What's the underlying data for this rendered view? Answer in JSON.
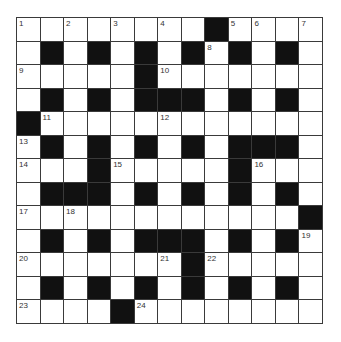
{
  "puzzle": {
    "rows": 13,
    "cols": 13,
    "colors": {
      "white_cell": "#ffffff",
      "black_cell": "#111111",
      "grid_line": "#3a3a3a",
      "number_text": "#333333"
    },
    "layout": [
      "........#....",
      ".#.#.#.#.#.#.",
      ".....#.......",
      ".#.#.###.#.#.",
      "#............",
      ".#.#.#.#.###.",
      "...#.....#...",
      ".###.#.#.#.#.",
      "............#",
      ".#.#.###.#.#.",
      ".......#.....",
      ".#.#.#.#.#.#.",
      "....#........"
    ],
    "numbers": [
      {
        "r": 0,
        "c": 0,
        "n": "1"
      },
      {
        "r": 0,
        "c": 2,
        "n": "2"
      },
      {
        "r": 0,
        "c": 4,
        "n": "3"
      },
      {
        "r": 0,
        "c": 6,
        "n": "4"
      },
      {
        "r": 0,
        "c": 9,
        "n": "5"
      },
      {
        "r": 0,
        "c": 10,
        "n": "6"
      },
      {
        "r": 0,
        "c": 12,
        "n": "7"
      },
      {
        "r": 1,
        "c": 8,
        "n": "8"
      },
      {
        "r": 2,
        "c": 0,
        "n": "9"
      },
      {
        "r": 2,
        "c": 6,
        "n": "10"
      },
      {
        "r": 4,
        "c": 1,
        "n": "11"
      },
      {
        "r": 4,
        "c": 6,
        "n": "12"
      },
      {
        "r": 5,
        "c": 0,
        "n": "13"
      },
      {
        "r": 6,
        "c": 0,
        "n": "14"
      },
      {
        "r": 6,
        "c": 4,
        "n": "15"
      },
      {
        "r": 6,
        "c": 10,
        "n": "16"
      },
      {
        "r": 8,
        "c": 0,
        "n": "17"
      },
      {
        "r": 8,
        "c": 2,
        "n": "18"
      },
      {
        "r": 9,
        "c": 12,
        "n": "19"
      },
      {
        "r": 10,
        "c": 0,
        "n": "20"
      },
      {
        "r": 10,
        "c": 6,
        "n": "21"
      },
      {
        "r": 10,
        "c": 8,
        "n": "22"
      },
      {
        "r": 12,
        "c": 0,
        "n": "23"
      },
      {
        "r": 12,
        "c": 5,
        "n": "24"
      }
    ],
    "entries": {}
  }
}
